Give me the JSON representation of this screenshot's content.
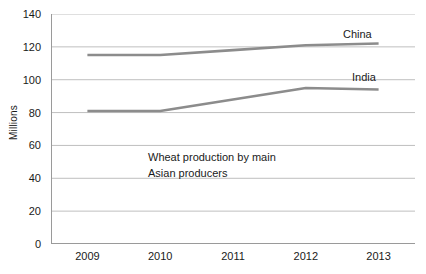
{
  "chart_data": {
    "type": "line",
    "title": "",
    "subtitle": "",
    "xlabel": "",
    "ylabel": "Millions",
    "categories": [
      "2009",
      "2010",
      "2011",
      "2012",
      "2013"
    ],
    "series": [
      {
        "name": "China",
        "values": [
          115,
          115,
          118,
          121,
          122
        ],
        "color": "#8c8c8c"
      },
      {
        "name": "India",
        "values": [
          81,
          81,
          88,
          95,
          94
        ],
        "color": "#8c8c8c"
      }
    ],
    "ylim": [
      0,
      140
    ],
    "yticks": [
      0,
      20,
      40,
      60,
      80,
      100,
      120,
      140
    ],
    "ytick_labels": [
      "0",
      "20",
      "40",
      "60",
      "80",
      "100",
      "120",
      "140"
    ],
    "grid": true,
    "grid_axis": "y",
    "legend": "none",
    "series_labels_inline": true,
    "annotations": [
      {
        "text": "Wheat production by main\nAsian producers",
        "x_category": "2010",
        "y_value": 55
      }
    ],
    "colors": {
      "grid": "#bfbfbf",
      "axis": "#8c8c8c",
      "text": "#1a1a1a",
      "series_china": "#8c8c8c",
      "series_india": "#8c8c8c",
      "background": "#ffffff"
    }
  },
  "labels": {
    "y_axis_title": "Millions",
    "annotation_text": "Wheat production by main\nAsian producers",
    "series_china": "China",
    "series_india": "India",
    "ytick_0": "0",
    "ytick_20": "20",
    "ytick_40": "40",
    "ytick_60": "60",
    "ytick_80": "80",
    "ytick_100": "100",
    "ytick_120": "120",
    "ytick_140": "140",
    "xtick_2009": "2009",
    "xtick_2010": "2010",
    "xtick_2011": "2011",
    "xtick_2012": "2012",
    "xtick_2013": "2013"
  }
}
